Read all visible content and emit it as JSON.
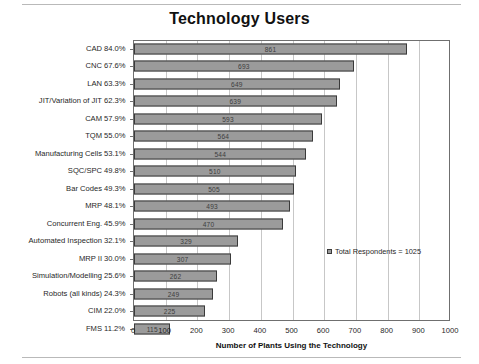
{
  "chart_data": {
    "type": "bar",
    "orientation": "horizontal",
    "title": "Technology Users",
    "xlabel": "Number of Plants Using the Technology",
    "ylabel": "",
    "xlim": [
      0,
      1000
    ],
    "xticks": [
      0,
      100,
      200,
      300,
      400,
      500,
      600,
      700,
      800,
      900,
      1000
    ],
    "grid": true,
    "legend": {
      "position": "inside-right",
      "entries": [
        "Total Respondents = 1025"
      ]
    },
    "total_respondents": 1025,
    "categories": [
      "CAD",
      "CNC",
      "LAN",
      "JIT/Variation of JIT",
      "CAM",
      "TQM",
      "Manufacturing Cells",
      "SQC/SPC",
      "Bar Codes",
      "MRP",
      "Concurrent Eng.",
      "Automated Inspection",
      "MRP II",
      "Simulation/Modelling",
      "Robots (all kinds)",
      "CIM",
      "FMS"
    ],
    "percent_labels": [
      "84.0%",
      "67.6%",
      "63.3%",
      "62.3%",
      "57.9%",
      "55.0%",
      "53.1%",
      "49.8%",
      "49.3%",
      "48.1%",
      "45.9%",
      "32.1%",
      "30.0%",
      "25.6%",
      "24.3%",
      "22.0%",
      "11.2%"
    ],
    "values": [
      861,
      693,
      649,
      639,
      593,
      564,
      544,
      510,
      505,
      493,
      470,
      329,
      307,
      262,
      249,
      225,
      115
    ],
    "bar_color": "#9b9b9b",
    "bar_border_color": "#3a3a3a"
  },
  "xtick_labels": [
    "0",
    "100",
    "200",
    "300",
    "400",
    "500",
    "600",
    "700",
    "800",
    "900",
    "1000"
  ],
  "legend_text": "Total Respondents = 1025"
}
